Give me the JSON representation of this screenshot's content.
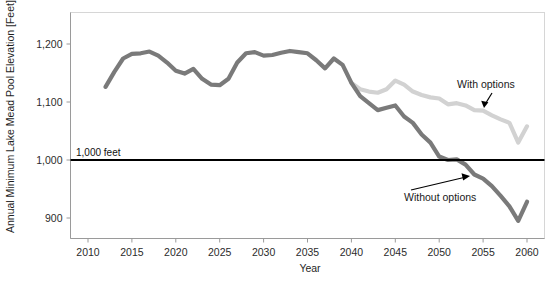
{
  "chart_data": {
    "type": "line",
    "title": "",
    "xlabel": "Year",
    "ylabel": "Annual Minimum Lake Mead Pool Elevation [Feet]",
    "xlim": [
      2008,
      2061
    ],
    "ylim": [
      855,
      1240
    ],
    "xticks": [
      2010,
      2015,
      2020,
      2025,
      2030,
      2035,
      2040,
      2045,
      2050,
      2055,
      2060
    ],
    "yticks": [
      900,
      1000,
      1100,
      1200
    ],
    "ytick_labels": [
      "900",
      "1,000",
      "1,100",
      "1,200"
    ],
    "xtick_labels": [
      "2010",
      "2015",
      "2020",
      "2025",
      "2030",
      "2035",
      "2040",
      "2045",
      "2050",
      "2055",
      "2060"
    ],
    "grid": false,
    "legend_position": "inline-annotations",
    "threshold": {
      "label": "1,000 feet",
      "value": 1000,
      "color": "#000000"
    },
    "annotations": [
      {
        "text": "With options",
        "target_series": "With options",
        "x": 2053,
        "y": 1120
      },
      {
        "text": "Without options",
        "target_series": "Without options",
        "x": 2048,
        "y": 955
      }
    ],
    "series": [
      {
        "name": "Without options",
        "color": "#7a7a7a",
        "x": [
          2012,
          2013,
          2014,
          2015,
          2016,
          2017,
          2018,
          2019,
          2020,
          2021,
          2022,
          2023,
          2024,
          2025,
          2026,
          2027,
          2028,
          2029,
          2030,
          2031,
          2032,
          2033,
          2034,
          2035,
          2036,
          2037,
          2038,
          2039,
          2040,
          2041,
          2042,
          2043,
          2044,
          2045,
          2046,
          2047,
          2048,
          2049,
          2050,
          2051,
          2052,
          2053,
          2054,
          2055,
          2056,
          2057,
          2058,
          2059,
          2060
        ],
        "values": [
          1126,
          1152,
          1175,
          1183,
          1184,
          1187,
          1180,
          1168,
          1154,
          1149,
          1157,
          1140,
          1130,
          1129,
          1140,
          1168,
          1184,
          1186,
          1180,
          1181,
          1185,
          1188,
          1186,
          1184,
          1172,
          1158,
          1175,
          1164,
          1133,
          1110,
          1098,
          1086,
          1090,
          1094,
          1075,
          1064,
          1044,
          1030,
          1006,
          1000,
          1001,
          992,
          975,
          968,
          955,
          938,
          920,
          895,
          928
        ]
      },
      {
        "name": "With options",
        "color": "#d2d2d2",
        "x": [
          2040,
          2041,
          2042,
          2043,
          2044,
          2045,
          2046,
          2047,
          2048,
          2049,
          2050,
          2051,
          2052,
          2053,
          2054,
          2055,
          2056,
          2057,
          2058,
          2059,
          2060
        ],
        "values": [
          1133,
          1122,
          1118,
          1116,
          1122,
          1137,
          1130,
          1118,
          1112,
          1108,
          1106,
          1096,
          1098,
          1094,
          1086,
          1085,
          1077,
          1070,
          1064,
          1030,
          1058
        ]
      }
    ]
  }
}
